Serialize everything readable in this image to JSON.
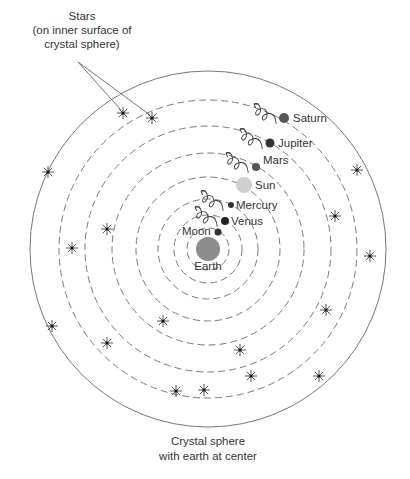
{
  "center": {
    "x": 208,
    "y": 249
  },
  "outer_sphere": {
    "radius": 178,
    "style": "solid"
  },
  "orbit_radii": [
    21,
    34,
    50,
    72,
    96,
    123,
    149
  ],
  "earth": {
    "label": "Earth",
    "x": 208,
    "y": 249,
    "r": 12,
    "color": "#8c8c8c",
    "label_x": 208,
    "label_y": 270
  },
  "bodies": [
    {
      "name": "Moon",
      "label": "Moon",
      "x": 218,
      "y": 232,
      "r": 3.5,
      "color": "#333333",
      "label_x": 182,
      "label_y": 235,
      "anchor": "start",
      "epicycle": false
    },
    {
      "name": "Venus",
      "label": "Venus",
      "x": 225,
      "y": 221,
      "r": 4,
      "color": "#222222",
      "label_x": 231,
      "label_y": 225,
      "anchor": "start",
      "epicycle": true
    },
    {
      "name": "Mercury",
      "label": "Mercury",
      "x": 231,
      "y": 205,
      "r": 3,
      "color": "#333333",
      "label_x": 236,
      "label_y": 209,
      "anchor": "start",
      "epicycle": true
    },
    {
      "name": "Sun",
      "label": "Sun",
      "x": 244,
      "y": 185,
      "r": 8,
      "color": "#cfcfcf",
      "label_x": 255,
      "label_y": 189,
      "anchor": "start",
      "epicycle": false
    },
    {
      "name": "Mars",
      "label": "Mars",
      "x": 256,
      "y": 167,
      "r": 4,
      "color": "#555555",
      "label_x": 263,
      "label_y": 164,
      "anchor": "start",
      "epicycle": true
    },
    {
      "name": "Jupiter",
      "label": "Jupiter",
      "x": 270,
      "y": 143,
      "r": 4.5,
      "color": "#333333",
      "label_x": 278,
      "label_y": 147,
      "anchor": "start",
      "epicycle": true
    },
    {
      "name": "Saturn",
      "label": "Saturn",
      "x": 284,
      "y": 118,
      "r": 5,
      "color": "#555555",
      "label_x": 293,
      "label_y": 122,
      "anchor": "start",
      "epicycle": true
    }
  ],
  "stars": [
    {
      "x": 123,
      "y": 113
    },
    {
      "x": 152,
      "y": 118
    },
    {
      "x": 48,
      "y": 172
    },
    {
      "x": 107,
      "y": 229
    },
    {
      "x": 72,
      "y": 248
    },
    {
      "x": 357,
      "y": 170
    },
    {
      "x": 335,
      "y": 216
    },
    {
      "x": 370,
      "y": 256
    },
    {
      "x": 52,
      "y": 326
    },
    {
      "x": 107,
      "y": 343
    },
    {
      "x": 163,
      "y": 321
    },
    {
      "x": 240,
      "y": 350
    },
    {
      "x": 251,
      "y": 376
    },
    {
      "x": 204,
      "y": 390
    },
    {
      "x": 319,
      "y": 376
    },
    {
      "x": 326,
      "y": 310
    },
    {
      "x": 176,
      "y": 391
    }
  ],
  "annotations": {
    "stars_label": [
      "Stars",
      "(on inner surface of",
      "crystal sphere)"
    ],
    "caption": [
      "Crystal sphere",
      "with earth at center"
    ]
  },
  "colors": {
    "line": "#777777",
    "dash": "#7a7a7a",
    "text": "#333333"
  }
}
